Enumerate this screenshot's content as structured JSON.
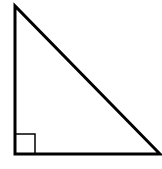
{
  "diagram": {
    "type": "right-triangle",
    "stroke_color": "#000000",
    "background_color": "#ffffff",
    "vertices": {
      "top": [
        15,
        6
      ],
      "bottom_left": [
        15,
        154
      ],
      "bottom_right": [
        160,
        154
      ]
    },
    "right_angle_marker": {
      "corner": "bottom_left",
      "size": 20
    },
    "labels": []
  }
}
